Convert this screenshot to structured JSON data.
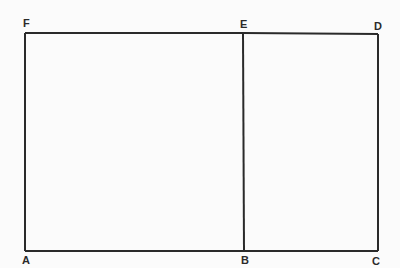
{
  "diagram": {
    "points": {
      "A": "A",
      "B": "B",
      "C": "C",
      "D": "D",
      "E": "E",
      "F": "F"
    },
    "segments": [
      "AB",
      "BC",
      "CD",
      "DE",
      "EF",
      "FA",
      "BE"
    ],
    "line_color": "#2a2a2a",
    "background": "#fbfbfb"
  }
}
